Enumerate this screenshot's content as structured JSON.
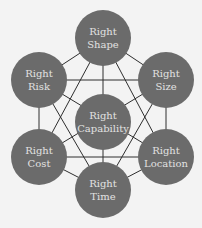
{
  "diagram": {
    "colors": {
      "node_fill": "#6b6b6b",
      "line": "#2e2e2e",
      "background": "#f3f3f3",
      "text": "#e2e2e2"
    },
    "nodes": [
      {
        "id": "shape",
        "line1": "Right",
        "line2": "Shape",
        "cx": 103,
        "cy": 38
      },
      {
        "id": "risk",
        "line1": "Right",
        "line2": "Risk",
        "cx": 39,
        "cy": 80
      },
      {
        "id": "size",
        "line1": "Right",
        "line2": "Size",
        "cx": 166,
        "cy": 80
      },
      {
        "id": "capability",
        "line1": "Right",
        "line2": "Capability",
        "cx": 103,
        "cy": 122
      },
      {
        "id": "cost",
        "line1": "Right",
        "line2": "Cost",
        "cx": 39,
        "cy": 157
      },
      {
        "id": "location",
        "line1": "Right",
        "line2": "Location",
        "cx": 166,
        "cy": 157
      },
      {
        "id": "time",
        "line1": "Right",
        "line2": "Time",
        "cx": 103,
        "cy": 190
      }
    ]
  }
}
